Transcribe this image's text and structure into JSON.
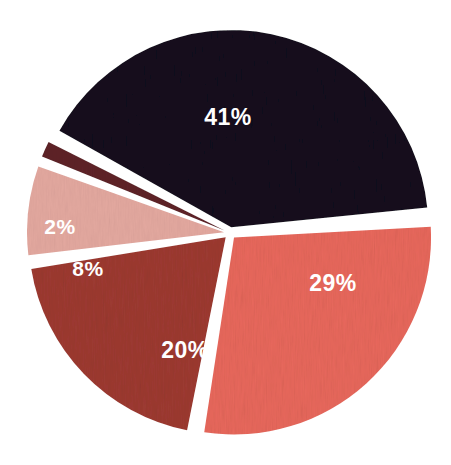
{
  "chart_data": {
    "type": "pie",
    "title": "",
    "subtitle": "",
    "xlabel": "",
    "ylabel": "",
    "legend": "none",
    "grid": false,
    "units": "percent",
    "total": 100,
    "background_color": "#ffffff",
    "label_color": "#ffffff",
    "exploded": true,
    "gap_degrees": 2.6,
    "start_angle_degrees": -62,
    "center": {
      "x": 230,
      "y": 233
    },
    "radius": 197,
    "categories": [
      "41%",
      "29%",
      "20%",
      "8%",
      "2%"
    ],
    "values": [
      41,
      29,
      20,
      8,
      2
    ],
    "labels": [
      "41%",
      "29%",
      "20%",
      "8%",
      "2%"
    ],
    "colors": [
      "#13101f",
      "#e8685c",
      "#9d3a31",
      "#e3a89f",
      "#5f2429"
    ],
    "slices": [
      {
        "label": "41%",
        "value": 41,
        "color": "#13101f",
        "color_name": "dark-navy-black",
        "start_angle": -62,
        "end_angle": 85.6,
        "label_x": 228,
        "label_y": 119
      },
      {
        "label": "29%",
        "value": 29,
        "color": "#e8685c",
        "color_name": "coral-red",
        "start_angle": 85.6,
        "end_angle": 190,
        "label_x": 333,
        "label_y": 285
      },
      {
        "label": "20%",
        "value": 20,
        "color": "#9d3a31",
        "color_name": "brick-red",
        "start_angle": 190,
        "end_angle": 262,
        "label_x": 185,
        "label_y": 352
      },
      {
        "label": "8%",
        "value": 8,
        "color": "#e3a89f",
        "color_name": "light-dusty-pink",
        "start_angle": 262,
        "end_angle": 290.8,
        "label_x": 88,
        "label_y": 270
      },
      {
        "label": "2%",
        "value": 2,
        "color": "#5f2429",
        "color_name": "dark-maroon",
        "start_angle": 290.8,
        "end_angle": 298,
        "label_x": 60,
        "label_y": 228
      }
    ]
  }
}
